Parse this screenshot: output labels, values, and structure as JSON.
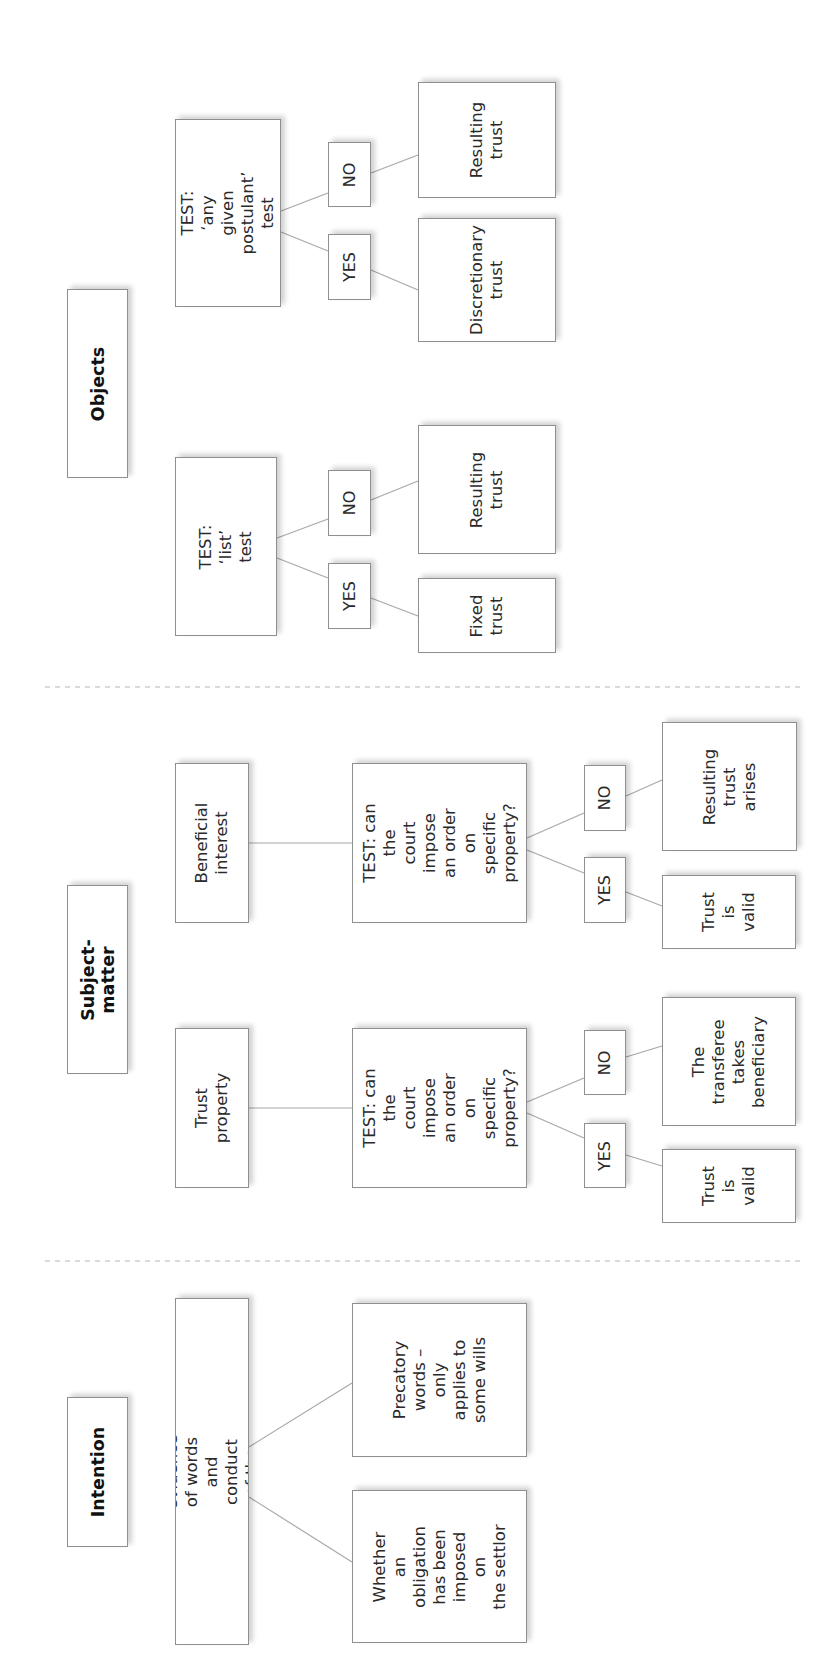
{
  "diagram": {
    "sections": [
      {
        "title": "Intention",
        "test": "TEST: evidence of words and\nconduct of the settlor",
        "outcomes": [
          "Whether an\nobligation\nhas been\nimposed on\nthe settlor",
          "Precatory\nwords –\nonly\napplies to\nsome wills"
        ]
      },
      {
        "title": "Subject-matter",
        "branches": [
          {
            "label": "Trust\nproperty",
            "test": "TEST: can the\ncourt impose\nan order on\nspecific\nproperty?",
            "yes_label": "YES",
            "no_label": "NO",
            "yes_outcome": "Trust\nis\nvalid",
            "no_outcome": "The\ntransferee\ntakes\nbeneficiary"
          },
          {
            "label": "Beneficial\ninterest",
            "test": "TEST: can the\ncourt impose\nan order on\nspecific\nproperty?",
            "yes_label": "YES",
            "no_label": "NO",
            "yes_outcome": "Trust\nis\nvalid",
            "no_outcome": "Resulting\ntrust\narises"
          }
        ]
      },
      {
        "title": "Objects",
        "branches": [
          {
            "test": "TEST: ‘list’ test",
            "yes_label": "YES",
            "no_label": "NO",
            "yes_outcome": "Fixed\ntrust",
            "no_outcome": "Resulting\ntrust"
          },
          {
            "test": "TEST: ‘any\ngiven postulant’\ntest",
            "yes_label": "YES",
            "no_label": "NO",
            "yes_outcome": "Discretionary\ntrust",
            "no_outcome": "Resulting\ntrust"
          }
        ]
      }
    ],
    "colors": {
      "box_border": "#8f8f8f",
      "connector": "#a8a8a8",
      "divider": "#b5b5b5",
      "text": "#2a2a2a"
    }
  }
}
